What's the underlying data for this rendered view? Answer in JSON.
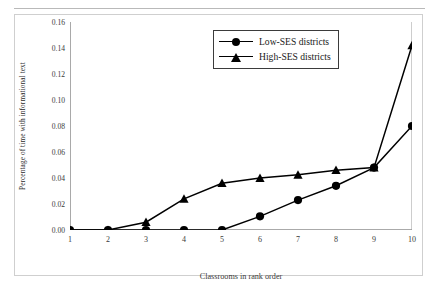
{
  "chart_data": {
    "type": "line",
    "title": "",
    "xlabel": "Classrooms in rank order",
    "ylabel": "Percentage of time with informational text",
    "x": [
      1,
      2,
      3,
      4,
      5,
      6,
      7,
      8,
      9,
      10
    ],
    "xtick_labels": [
      "1",
      "2",
      "3",
      "4",
      "5",
      "6",
      "7",
      "8",
      "9",
      "10"
    ],
    "xlim": [
      1,
      10
    ],
    "ylim": [
      0.0,
      0.16
    ],
    "ytick_labels": [
      "0.00",
      "0.02",
      "0.04",
      "0.06",
      "0.08",
      "0.10",
      "0.12",
      "0.14",
      "0.16"
    ],
    "yticks": [
      0.0,
      0.02,
      0.04,
      0.06,
      0.08,
      0.1,
      0.12,
      0.14,
      0.16
    ],
    "grid": false,
    "legend_position": "upper center",
    "series": [
      {
        "name": "Low-SES districts",
        "marker": "circle",
        "color": "#000000",
        "values": [
          0.0,
          0.0,
          0.0,
          0.0,
          0.0,
          0.0105,
          0.023,
          0.034,
          0.048,
          0.08
        ]
      },
      {
        "name": "High-SES districts",
        "marker": "triangle",
        "color": "#000000",
        "values": [
          0.0,
          0.0,
          0.006,
          0.024,
          0.036,
          0.04,
          0.0425,
          0.046,
          0.048,
          0.142
        ]
      }
    ]
  },
  "legend": {
    "items": [
      {
        "label": "Low-SES districts",
        "marker": "circle"
      },
      {
        "label": "High-SES districts",
        "marker": "triangle"
      }
    ]
  }
}
